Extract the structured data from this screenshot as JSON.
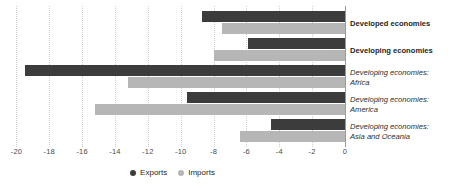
{
  "chart_data": {
    "type": "bar",
    "orientation": "horizontal",
    "title": "",
    "xlabel": "",
    "ylabel": "",
    "xlim": [
      -21,
      0
    ],
    "xticks": [
      -20,
      -18,
      -16,
      -14,
      -12,
      -10,
      -8,
      -6,
      -4,
      -2,
      0
    ],
    "xtick_labels": [
      "-20",
      "-18",
      "-16",
      "-14",
      "-12",
      "-10",
      "-8",
      "-6",
      "-4",
      "-2",
      "0"
    ],
    "grid": true,
    "grid_axis": "x",
    "legend_position": "bottom",
    "categories": [
      "Developed economies",
      "Developing economies",
      "Developing economies: Africa",
      "Developing economies: America",
      "Developing economies: Asia and Oceania"
    ],
    "category_lines": [
      [
        "Developed economies"
      ],
      [
        "Developing economies"
      ],
      [
        "Developing economies:",
        "Africa"
      ],
      [
        "Developing economies:",
        "America"
      ],
      [
        "Developing economies:",
        "Asia and Oceania"
      ]
    ],
    "category_styles": [
      "bold",
      "bold",
      "italic",
      "italic",
      "italic"
    ],
    "series": [
      {
        "name": "Exports",
        "color": "#3c3c3c",
        "values": [
          -8.7,
          -5.9,
          -19.5,
          -9.6,
          -4.5
        ]
      },
      {
        "name": "Imports",
        "color": "#b6b6b6",
        "values": [
          -7.5,
          -8.0,
          -13.2,
          -15.2,
          -6.4
        ]
      }
    ]
  },
  "legend": {
    "items": [
      {
        "label": "Exports",
        "color": "#3c3c3c"
      },
      {
        "label": "Imports",
        "color": "#b6b6b6"
      }
    ]
  },
  "colors": {
    "exports": "#3c3c3c",
    "imports": "#b6b6b6",
    "gridline": "#cfcfcf",
    "axis": "#9a9a9a",
    "background": "#ffffff"
  }
}
